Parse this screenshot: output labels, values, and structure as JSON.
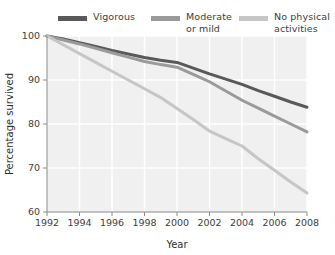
{
  "legend": {
    "items": [
      {
        "label": "Vigorous",
        "color": "#595959",
        "swatch_name": "legend-swatch-vigorous"
      },
      {
        "label": "Moderate\nor mild",
        "color": "#9a9a9a",
        "swatch_name": "legend-swatch-moderate"
      },
      {
        "label": "No physical\nactivities",
        "color": "#c6c6c6",
        "swatch_name": "legend-swatch-none"
      }
    ]
  },
  "axes": {
    "x_title": "Year",
    "y_title": "Percentage survived",
    "x_ticks": [
      "1992",
      "1994",
      "1996",
      "1998",
      "2000",
      "2002",
      "2004",
      "2006",
      "2008"
    ],
    "y_ticks": [
      "60",
      "70",
      "80",
      "90",
      "100"
    ]
  },
  "chart_data": {
    "type": "line",
    "title": "",
    "subtitle": "",
    "xlabel": "Year",
    "ylabel": "Percentage survived",
    "xlim": [
      1992,
      2008
    ],
    "ylim": [
      60,
      100
    ],
    "xticks": [
      1992,
      1994,
      1996,
      1998,
      2000,
      2002,
      2004,
      2006,
      2008
    ],
    "yticks": [
      60,
      70,
      80,
      90,
      100
    ],
    "grid": true,
    "legend_position": "top",
    "x": [
      1992,
      1993,
      1994,
      1995,
      1996,
      1997,
      1998,
      1999,
      2000,
      2001,
      2002,
      2003,
      2004,
      2005,
      2006,
      2007,
      2008
    ],
    "series": [
      {
        "name": "Vigorous",
        "color": "#595959",
        "values": [
          100,
          99.3,
          98.5,
          97.6,
          96.7,
          95.9,
          95.1,
          94.5,
          94.0,
          92.7,
          91.4,
          90.2,
          89.0,
          87.6,
          86.3,
          85.0,
          83.8
        ]
      },
      {
        "name": "Moderate or mild",
        "color": "#9a9a9a",
        "values": [
          100,
          99.1,
          98.2,
          97.2,
          96.2,
          95.2,
          94.2,
          93.5,
          92.9,
          91.3,
          89.6,
          87.5,
          85.4,
          83.6,
          81.8,
          80.0,
          78.2
        ]
      },
      {
        "name": "No physical activities",
        "color": "#c6c6c6",
        "values": [
          100,
          98.0,
          96.0,
          94.0,
          92.0,
          90.0,
          88.0,
          86.0,
          83.5,
          81.0,
          78.4,
          76.7,
          75.0,
          72.1,
          69.5,
          66.8,
          64.3
        ]
      }
    ]
  },
  "style": {
    "plot_background": "#f0f0f0",
    "gridline_color": "#ffffff",
    "axis_color": "#8c8c8c",
    "text_color": "#3d3d3d"
  }
}
